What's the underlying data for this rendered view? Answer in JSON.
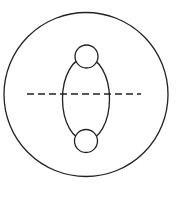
{
  "diagram": {
    "width": 177,
    "height": 200,
    "background": "#ffffff",
    "stroke_color": "#222222",
    "stroke_width": 1.3,
    "outer_circle": {
      "cx": 86,
      "cy": 94.5,
      "r": 82
    },
    "inner_ellipse": {
      "cx": 86,
      "cy": 99,
      "rx": 23.5,
      "ry": 41.5
    },
    "top_circle": {
      "cx": 86.5,
      "cy": 56.5,
      "r": 11.5
    },
    "bottom_circle": {
      "cx": 86,
      "cy": 141,
      "r": 11.5
    },
    "dashed_line": {
      "x1": 27,
      "y1": 94,
      "x2": 141,
      "y2": 94,
      "dash": "7 4"
    }
  }
}
